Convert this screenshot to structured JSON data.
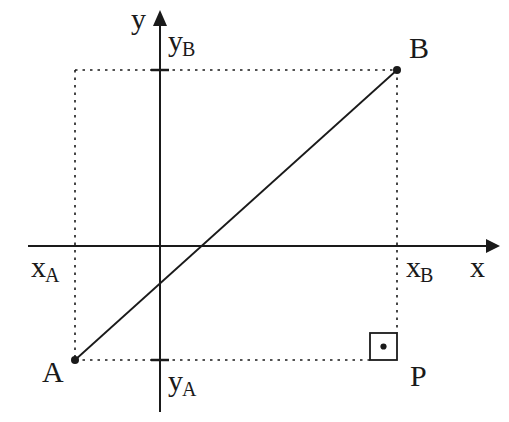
{
  "figure": {
    "type": "geometry-diagram",
    "background_color": "#ffffff",
    "stroke_color": "#1a1a1a"
  },
  "axes": {
    "x_axis": {
      "label": "x",
      "arrow": "right",
      "y_position": 246,
      "x_start": 28,
      "x_end": 492
    },
    "y_axis": {
      "label": "y",
      "arrow": "up",
      "x_position": 160,
      "y_start": 18,
      "y_end": 412
    }
  },
  "tick_labels": {
    "x_a": {
      "base": "x",
      "sub": "A"
    },
    "x_b": {
      "base": "x",
      "sub": "B"
    },
    "y_a": {
      "base": "y",
      "sub": "A"
    },
    "y_b": {
      "base": "y",
      "sub": "B"
    }
  },
  "points": [
    {
      "name": "A",
      "label": "A",
      "x": 75,
      "y": 360
    },
    {
      "name": "B",
      "label": "B",
      "x": 397,
      "y": 70
    },
    {
      "name": "P",
      "label": "P",
      "x": 397,
      "y": 360
    }
  ],
  "segments": [
    {
      "name": "AB",
      "from": "A",
      "to": "B",
      "style": "solid"
    },
    {
      "name": "AP",
      "from": "A",
      "to": "P",
      "style": "dotted"
    },
    {
      "name": "BP",
      "from": "B",
      "to": "P",
      "style": "dotted"
    }
  ],
  "guides": {
    "vertical_from_a": {
      "x": 75,
      "y_top": 70,
      "y_bottom": 360,
      "style": "dotted"
    },
    "horizontal_at_yb": {
      "y": 70,
      "x_left": 75,
      "x_right": 397,
      "style": "dotted"
    },
    "horizontal_at_ya": {
      "y": 360,
      "x_left": 75,
      "x_right": 370,
      "style": "dotted"
    },
    "vertical_from_b": {
      "x": 397,
      "y_top": 70,
      "y_bottom": 333,
      "style": "dotted"
    }
  },
  "right_angle_marker": {
    "name": "right-angle-square",
    "x": 370,
    "y": 333,
    "size": 27,
    "has_center_dot": true
  }
}
